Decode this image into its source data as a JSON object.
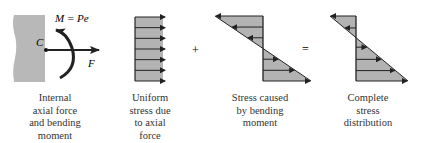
{
  "panels": [
    {
      "id": "internal-forces",
      "caption": [
        "Internal",
        "axial force",
        "and bending",
        "moment"
      ],
      "labels": {
        "centroid": "C",
        "moment": "M = Pe",
        "force": "F"
      }
    },
    {
      "id": "uniform-stress",
      "caption": [
        "Uniform",
        "stress due",
        "to axial",
        "force"
      ]
    },
    {
      "id": "bending-stress",
      "caption": [
        "Stress caused",
        "by bending",
        "moment"
      ]
    },
    {
      "id": "complete-stress",
      "caption": [
        "Complete",
        "stress",
        "distribution"
      ]
    }
  ],
  "operators": {
    "plus": "+",
    "equals": "="
  },
  "colors": {
    "fill": "#b3b3b3",
    "stroke": "#222222",
    "section": "#b8b8b8"
  }
}
